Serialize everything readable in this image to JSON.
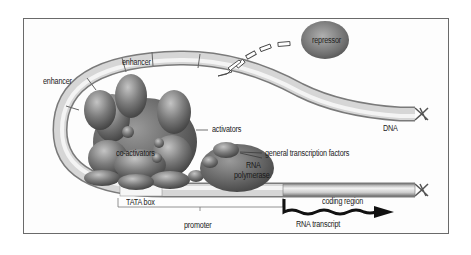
{
  "diagram": {
    "type": "transcription-regulation",
    "labels": {
      "repressor": "repressor",
      "enhancer_top": "enhancer",
      "enhancer_left": "enhancer",
      "activators": "activators",
      "dna": "DNA",
      "co_activators": "co-activators",
      "rna_polymerase_line1": "RNA",
      "rna_polymerase_line2": "polymerase",
      "general_transcription_factors": "general transcription factors",
      "tata_box": "TATA box",
      "coding_region": "coding region",
      "promoter": "promoter",
      "rna_transcript": "RNA transcript"
    },
    "colors": {
      "frame": "#6a6a6a",
      "dna_light": "#e8e8e8",
      "dna_dark": "#8a8a8a",
      "protein_light": "#a8a8a8",
      "protein_dark": "#4a4a4a",
      "transcript": "#111111"
    }
  }
}
